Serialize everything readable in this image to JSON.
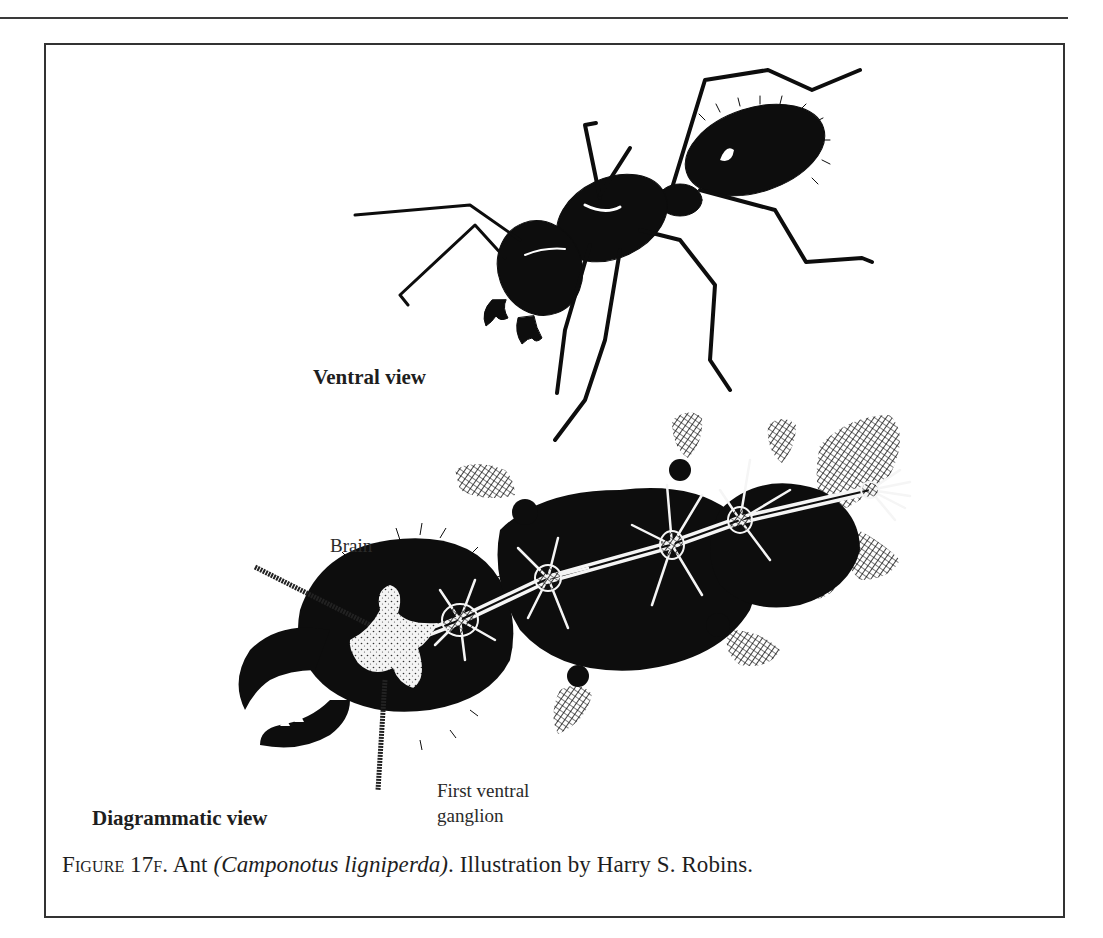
{
  "page": {
    "top_rule": true
  },
  "figure": {
    "labels": {
      "ventral_view": "Ventral view",
      "diagrammatic_view": "Diagrammatic view",
      "brain": "Brain",
      "first_ventral_ganglion_line1": "First ventral",
      "first_ventral_ganglion_line2": "ganglion"
    },
    "caption": {
      "figure_number": "Figure 17f.",
      "subject": "Ant",
      "species": "(Camponotus ligniperda)",
      "credit": ". Illustration by Harry S. Robins."
    },
    "illustrations": [
      {
        "name": "ant-ventral-view",
        "description": "Engraving of carpenter ant, ventral view"
      },
      {
        "name": "ant-diagrammatic-view",
        "description": "Diagram of ant nervous system showing brain and ventral ganglia chain"
      }
    ],
    "colors": {
      "ink": "#0d0d0d",
      "paper": "#ffffff",
      "rule": "#333333"
    }
  }
}
